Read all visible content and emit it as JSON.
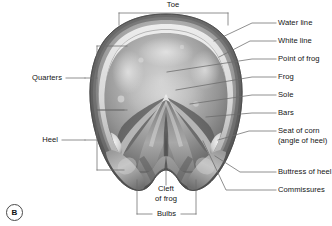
{
  "figure": {
    "panel_tag": "B",
    "background_color": "#ffffff",
    "line_color": "#5a5a5a",
    "text_color": "#141414"
  },
  "labels": {
    "toe": "Toe",
    "quarters": "Quarters",
    "heel": "Heel",
    "water_line": "Water line",
    "white_line": "White line",
    "point_of_frog": "Point of frog",
    "frog": "Frog",
    "sole": "Sole",
    "bars": "Bars",
    "seat_of_corn_line1": "Seat of corn",
    "seat_of_corn_line2": "(angle of heel)",
    "buttress_of_heel": "Buttress of heel",
    "commissures": "Commissures",
    "cleft_of_frog_line1": "Cleft",
    "cleft_of_frog_line2": "of frog",
    "bulbs": "Bulbs"
  },
  "callouts": [
    {
      "id": "toe",
      "label": "Toe",
      "side": "top",
      "marker": "bracket"
    },
    {
      "id": "quarters",
      "label": "Quarters",
      "side": "left",
      "marker": "bracket"
    },
    {
      "id": "heel",
      "label": "Heel",
      "side": "left",
      "marker": "bracket"
    },
    {
      "id": "water-line",
      "label": "Water line",
      "side": "right",
      "marker": "leader"
    },
    {
      "id": "white-line",
      "label": "White line",
      "side": "right",
      "marker": "leader"
    },
    {
      "id": "point-of-frog",
      "label": "Point of frog",
      "side": "right",
      "marker": "leader"
    },
    {
      "id": "frog",
      "label": "Frog",
      "side": "right",
      "marker": "leader"
    },
    {
      "id": "sole",
      "label": "Sole",
      "side": "right",
      "marker": "leader"
    },
    {
      "id": "bars",
      "label": "Bars",
      "side": "right",
      "marker": "leader"
    },
    {
      "id": "seat-of-corn",
      "label": "Seat of corn (angle of heel)",
      "side": "right",
      "marker": "leader"
    },
    {
      "id": "buttress-of-heel",
      "label": "Buttress of heel",
      "side": "right",
      "marker": "leader"
    },
    {
      "id": "commissures",
      "label": "Commissures",
      "side": "right",
      "marker": "leader"
    },
    {
      "id": "cleft-of-frog",
      "label": "Cleft of frog",
      "side": "bottom",
      "marker": "leader"
    },
    {
      "id": "bulbs",
      "label": "Bulbs",
      "side": "bottom",
      "marker": "bracket"
    }
  ]
}
